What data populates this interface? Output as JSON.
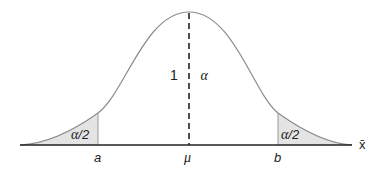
{
  "diagram": {
    "type": "normal-distribution-confidence-interval",
    "center_label": "1 − α",
    "center_label_one": "1",
    "center_label_alpha": "α",
    "left_tail_label": "α/2",
    "right_tail_label": "α/2",
    "tail_alpha": "α",
    "tail_half": "/2",
    "x_labels": {
      "a": "a",
      "mu": "μ",
      "b": "b"
    },
    "axis_label": "x̄",
    "colors": {
      "curve": "#8c8c8c",
      "tail_fill": "#e4e4e4",
      "axis": "#222222",
      "dashed_line": "#222222",
      "text": "#222222"
    }
  }
}
